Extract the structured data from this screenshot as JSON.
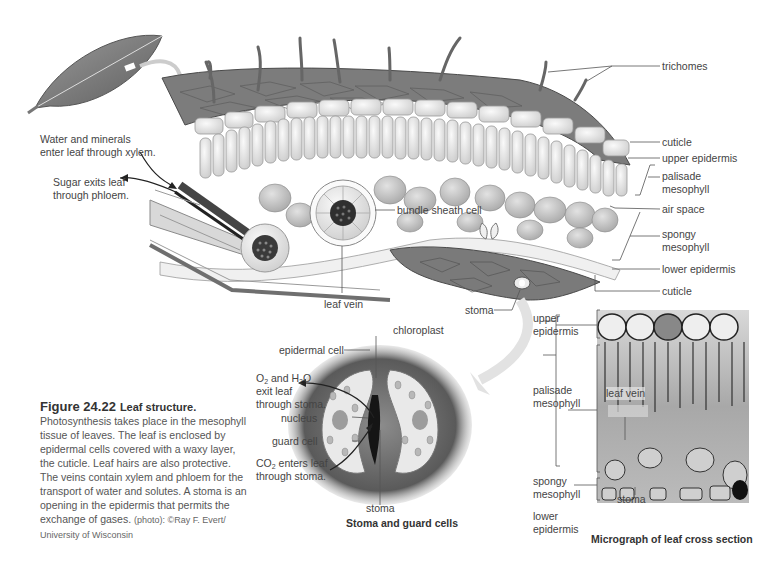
{
  "figure": {
    "number": "Figure 24.22",
    "title": "Leaf structure.",
    "caption": "Photosynthesis takes place in the mesophyll tissue of leaves. The leaf is enclosed by epidermal cells covered with a waxy layer, the cuticle. Leaf hairs are also protective. The veins contain xylem and phloem for the transport of water and solutes. A stoma is an opening in the epidermis that permits the exchange of gases.",
    "credit": "(photo): ©Ray F. Evert/ University of Wisconsin"
  },
  "main_diagram": {
    "notes": {
      "xylem": "Water and minerals enter leaf through xylem.",
      "xylem_line1": "Water and minerals",
      "xylem_line2": "enter leaf through xylem.",
      "phloem_line1": "Sugar exits leaf",
      "phloem_line2": "through phloem."
    },
    "labels": {
      "trichomes": "trichomes",
      "cuticle_top": "cuticle",
      "upper_epidermis": "upper epidermis",
      "palisade_1": "palisade",
      "palisade_2": "mesophyll",
      "air_space": "air space",
      "spongy_1": "spongy",
      "spongy_2": "mesophyll",
      "lower_epidermis": "lower epidermis",
      "cuticle_bottom": "cuticle",
      "bundle_sheath": "bundle sheath cell",
      "leaf_vein": "leaf vein",
      "stoma": "stoma"
    }
  },
  "stoma_diagram": {
    "subcaption": "Stoma and guard cells",
    "labels": {
      "chloroplast": "chloroplast",
      "epidermal_cell": "epidermal cell",
      "o2_exit_1a": "O",
      "o2_exit_1b": "2",
      "o2_exit_1c": " and H",
      "o2_exit_1d": "2",
      "o2_exit_1e": "O",
      "o2_exit_2": "exit leaf",
      "o2_exit_3": "through stoma.",
      "nucleus": "nucleus",
      "guard_cell": "guard cell",
      "co2_1a": "CO",
      "co2_1b": "2",
      "co2_1c": " enters leaf",
      "co2_2": "through stoma.",
      "stoma": "stoma"
    }
  },
  "micrograph": {
    "subcaption": "Micrograph of leaf cross section",
    "labels": {
      "upper_1": "upper",
      "upper_2": "epidermis",
      "palisade_1": "palisade",
      "palisade_2": "mesophyll",
      "leaf_vein": "leaf vein",
      "spongy_1": "spongy",
      "spongy_2": "mesophyll",
      "stoma": "stoma",
      "lower_1": "lower",
      "lower_2": "epidermis"
    }
  },
  "colors": {
    "epidermis_dark": "#6f6f6f",
    "cell_light": "#e9e9e9",
    "leader_line": "#555555"
  }
}
